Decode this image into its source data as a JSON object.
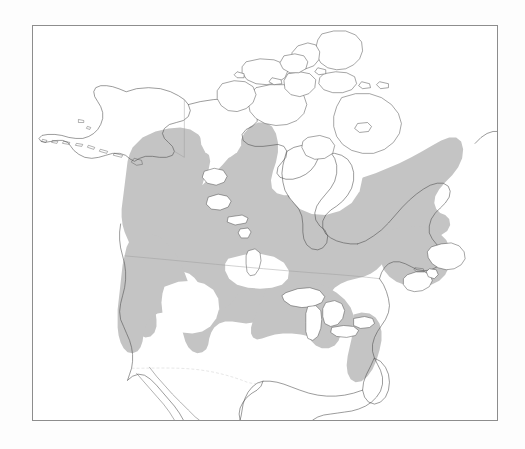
{
  "figure": {
    "type": "range-map",
    "title": "",
    "caption": "",
    "region": "North America",
    "projection_hint": "conic",
    "background_color": "#fdfdfd",
    "frame": {
      "x": 32,
      "y": 25,
      "width": 466,
      "height": 396,
      "border_color": "#8d8d8d",
      "fill_color": "#ffffff"
    }
  },
  "legend": {
    "present": false,
    "entries": [
      {
        "label": "",
        "swatch_color": "#c4c4c4",
        "meaning": "shaded distribution / range area"
      }
    ]
  },
  "map_layers": {
    "coastline": {
      "name": "coastline",
      "stroke_color": "#4a4a4a",
      "stroke_width": 0.55
    },
    "political_borders": {
      "name": "political-borders",
      "stroke_color": "#9a9a9a",
      "stroke_width": 0.45
    },
    "lakes": {
      "name": "lakes",
      "fill_color": "#ffffff",
      "stroke_color": "#4a4a4a"
    },
    "range_shading": {
      "name": "species-range",
      "fill_color": "#c4c4c4",
      "description": "boreal forest band from interior Alaska and Yukon east across Canada to Labrador and Newfoundland, south along the Rocky Mountains and Pacific Northwest coast, around the Great Lakes, and down the Appalachian Mountains"
    }
  },
  "chart_data": {
    "type": "map",
    "title": "",
    "xlabel": "",
    "ylabel": "",
    "regions_shaded": [
      "Interior Alaska",
      "Yukon",
      "Northwest Territories (southern)",
      "British Columbia",
      "Alberta",
      "Saskatchewan (northern)",
      "Manitoba",
      "Ontario",
      "Quebec",
      "Labrador",
      "Newfoundland",
      "New Brunswick",
      "Nova Scotia",
      "Washington",
      "Oregon",
      "Idaho",
      "Montana",
      "Wyoming",
      "Utah (mountains)",
      "Colorado (mountains)",
      "Minnesota",
      "Wisconsin",
      "Michigan",
      "New York",
      "New England",
      "Appalachian Mountains"
    ],
    "regions_unshaded": [
      "Arctic Archipelago",
      "Greenland",
      "Hudson Bay",
      "Great Basin",
      "Great Plains (southern)",
      "Southeastern United States",
      "Mexico",
      "Baja California",
      "Aleutian Islands",
      "Alaska North Slope"
    ]
  }
}
